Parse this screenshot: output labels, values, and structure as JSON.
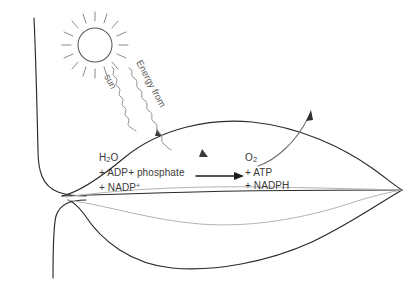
{
  "figure": {
    "colors": {
      "outline": "#2b2b2b",
      "vein": "#b3b3b3",
      "sun": "#565656",
      "wave": "#8a8a8a",
      "reaction_arrow": "#1d1d1d",
      "text": "#3a3a3a",
      "background": "#ffffff"
    }
  },
  "sun": {
    "icon": "sun-icon",
    "center_x": 95,
    "center_y": 45,
    "radius": 17,
    "ray_count": 16
  },
  "energy_label": {
    "line1": "Energy from",
    "line2": "sun",
    "rotation_deg": 62
  },
  "reactants": {
    "line1_prefix": "H",
    "line1_sub": "2",
    "line1_suffix": "O",
    "line2": "+ ADP+ phosphate",
    "line3_prefix": "+ NADP",
    "line3_sup": "+"
  },
  "products": {
    "line1_prefix": "O",
    "line1_sub": "2",
    "line2": "+ ATP",
    "line3": "+ NADPH"
  },
  "reaction_arrow": {
    "name": "reaction-arrow",
    "x1": 196,
    "x2": 242,
    "y": 176
  },
  "oxygen_arrow": {
    "name": "oxygen-release-arrow",
    "from_x": 258,
    "from_y": 166,
    "to_x": 312,
    "to_y": 111
  },
  "light_waves": [
    {
      "name": "light-wave-left",
      "from_x": 112,
      "from_y": 66,
      "to_x": 158,
      "to_y": 133
    },
    {
      "name": "light-wave-right",
      "from_x": 128,
      "from_y": 68,
      "to_x": 205,
      "to_y": 156
    }
  ]
}
